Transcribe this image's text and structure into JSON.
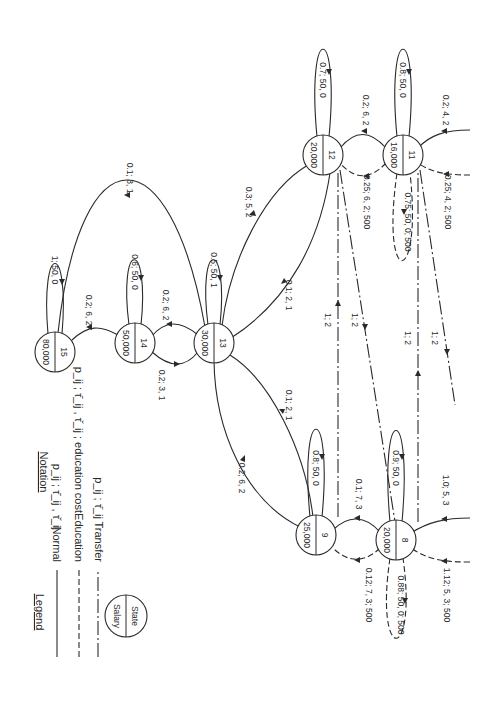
{
  "figure": {
    "orientation": "rotated 90 degrees clockwise (text reads top-to-bottom)",
    "legend": {
      "title": "Legend",
      "notation_title": "Notation",
      "items": [
        {
          "type": "normal",
          "label": "Normal",
          "notation": "p_ij ; τ̄_ij , τ̌_ij"
        },
        {
          "type": "education",
          "label": "Education",
          "notation": "p_ij ; τ̄_ij , τ̌_ij ;  education cost"
        },
        {
          "type": "transfer",
          "label": "Transfer",
          "notation": "p_ij ; τ̄_ij"
        }
      ],
      "node_key": {
        "top": "State",
        "bottom": "Salary"
      }
    },
    "nodes": [
      {
        "id": "15",
        "salary": "80,000"
      },
      {
        "id": "14",
        "salary": "50,000"
      },
      {
        "id": "13",
        "salary": "30,000"
      },
      {
        "id": "12",
        "salary": "20,000"
      },
      {
        "id": "11",
        "salary": "16,000"
      },
      {
        "id": "9",
        "salary": "25,000"
      },
      {
        "id": "8",
        "salary": "20,000"
      }
    ],
    "edges": [
      {
        "from": "15",
        "to": "15",
        "type": "normal",
        "label": "1; 50, 0"
      },
      {
        "from": "14",
        "to": "14",
        "type": "normal",
        "label": "0.6; 50, 0"
      },
      {
        "from": "13",
        "to": "13",
        "type": "normal",
        "label": "0.5; 50, 1"
      },
      {
        "from": "12",
        "to": "12",
        "type": "normal",
        "label": "0.7; 50, 0"
      },
      {
        "from": "11",
        "to": "11",
        "type": "normal",
        "label": "0.8; 50, 0"
      },
      {
        "from": "9",
        "to": "9",
        "type": "normal",
        "label": "0.8; 50, 0"
      },
      {
        "from": "8",
        "to": "8",
        "type": "normal",
        "label": "0.9; 50, 0"
      },
      {
        "from": "14",
        "to": "15",
        "type": "normal",
        "label": "0.2; 6, 2"
      },
      {
        "from": "13",
        "to": "14",
        "type": "normal",
        "label": "0.2; 6, 2"
      },
      {
        "from": "14",
        "to": "13",
        "type": "normal",
        "label": "0.2; 3, 1"
      },
      {
        "from": "13",
        "to": "15",
        "type": "normal",
        "label": "0.1; 3, 1"
      },
      {
        "from": "12",
        "to": "13",
        "type": "normal",
        "label": "0.3; 5, 2"
      },
      {
        "from": "13",
        "to": "12",
        "type": "normal",
        "label": "0.1; 2, 1"
      },
      {
        "from": "13",
        "to": "9",
        "type": "normal",
        "label": "0.1; 2, 1"
      },
      {
        "from": "9",
        "to": "13",
        "type": "normal",
        "label": "0.2; 6, 2"
      },
      {
        "from": "11",
        "to": "12",
        "type": "normal",
        "label": "0.2; 6, 2"
      },
      {
        "from": "11",
        "to": "12",
        "type": "education",
        "label": "0.25; 6, 2; 500"
      },
      {
        "from": "11",
        "to": "11",
        "type": "education",
        "label": "0.75; 50, 0; 500"
      },
      {
        "from": "in",
        "to": "11",
        "type": "normal",
        "label": "0.2; 4, 2"
      },
      {
        "from": "in",
        "to": "11",
        "type": "education",
        "label": "0.25; 4, 2; 500"
      },
      {
        "from": "8",
        "to": "9",
        "type": "normal",
        "label": "0.1; 7, 3"
      },
      {
        "from": "8",
        "to": "9",
        "type": "education",
        "label": "0.12; 7, 3; 500"
      },
      {
        "from": "8",
        "to": "8",
        "type": "education",
        "label": "0.88; 50, 0; 500"
      },
      {
        "from": "in",
        "to": "8",
        "type": "normal",
        "label": "1.0; 5, 3"
      },
      {
        "from": "in",
        "to": "8",
        "type": "education",
        "label": "1.12; 5, 3; 500"
      },
      {
        "from": "9",
        "to": "12",
        "type": "transfer",
        "label": "1; 2"
      },
      {
        "from": "12",
        "to": "8",
        "type": "transfer",
        "label": "1; 2"
      },
      {
        "from": "8",
        "to": "11",
        "type": "transfer",
        "label": "1; 2"
      },
      {
        "from": "11",
        "to": "out",
        "type": "transfer",
        "label": "1; 2"
      }
    ]
  }
}
